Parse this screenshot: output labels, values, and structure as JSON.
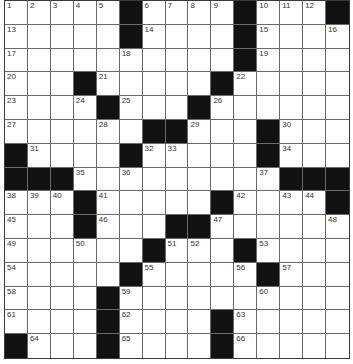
{
  "puzzle": {
    "rows": 15,
    "cols": 15,
    "colors": {
      "black": "#111111",
      "white": "#ffffff",
      "line": "#6a6a6a",
      "number": "#333333"
    },
    "grid": [
      ".....#....#...#",
      ".....#....#....",
      "..........#....",
      "...#.....#.....",
      "....#...#......",
      "......##...#...",
      "#....#.....#...",
      "###.........###",
      "...#.....#....#",
      "...#...##......",
      "......#...#....",
      ".....#.....#...",
      "....#..........",
      "....#....#.....",
      "#...#....#....."
    ],
    "numbers": [
      {
        "r": 1,
        "c": 1,
        "n": "1"
      },
      {
        "r": 1,
        "c": 2,
        "n": "2"
      },
      {
        "r": 1,
        "c": 3,
        "n": "3"
      },
      {
        "r": 1,
        "c": 4,
        "n": "4"
      },
      {
        "r": 1,
        "c": 5,
        "n": "5"
      },
      {
        "r": 1,
        "c": 7,
        "n": "6"
      },
      {
        "r": 1,
        "c": 8,
        "n": "7"
      },
      {
        "r": 1,
        "c": 9,
        "n": "8"
      },
      {
        "r": 1,
        "c": 10,
        "n": "9"
      },
      {
        "r": 1,
        "c": 12,
        "n": "10"
      },
      {
        "r": 1,
        "c": 13,
        "n": "11"
      },
      {
        "r": 1,
        "c": 14,
        "n": "12"
      },
      {
        "r": 2,
        "c": 1,
        "n": "13"
      },
      {
        "r": 2,
        "c": 7,
        "n": "14"
      },
      {
        "r": 2,
        "c": 12,
        "n": "15"
      },
      {
        "r": 2,
        "c": 15,
        "n": "16"
      },
      {
        "r": 3,
        "c": 1,
        "n": "17"
      },
      {
        "r": 3,
        "c": 6,
        "n": "18"
      },
      {
        "r": 3,
        "c": 12,
        "n": "19"
      },
      {
        "r": 4,
        "c": 1,
        "n": "20"
      },
      {
        "r": 4,
        "c": 5,
        "n": "21"
      },
      {
        "r": 4,
        "c": 11,
        "n": "22"
      },
      {
        "r": 5,
        "c": 1,
        "n": "23"
      },
      {
        "r": 5,
        "c": 4,
        "n": "24"
      },
      {
        "r": 5,
        "c": 6,
        "n": "25"
      },
      {
        "r": 5,
        "c": 10,
        "n": "26"
      },
      {
        "r": 6,
        "c": 1,
        "n": "27"
      },
      {
        "r": 6,
        "c": 5,
        "n": "28"
      },
      {
        "r": 6,
        "c": 9,
        "n": "29"
      },
      {
        "r": 6,
        "c": 13,
        "n": "30"
      },
      {
        "r": 7,
        "c": 2,
        "n": "31"
      },
      {
        "r": 7,
        "c": 7,
        "n": "32"
      },
      {
        "r": 7,
        "c": 8,
        "n": "33"
      },
      {
        "r": 7,
        "c": 13,
        "n": "34"
      },
      {
        "r": 8,
        "c": 4,
        "n": "35"
      },
      {
        "r": 8,
        "c": 6,
        "n": "36"
      },
      {
        "r": 8,
        "c": 12,
        "n": "37"
      },
      {
        "r": 9,
        "c": 1,
        "n": "38"
      },
      {
        "r": 9,
        "c": 2,
        "n": "39"
      },
      {
        "r": 9,
        "c": 3,
        "n": "40"
      },
      {
        "r": 9,
        "c": 5,
        "n": "41"
      },
      {
        "r": 9,
        "c": 11,
        "n": "42"
      },
      {
        "r": 9,
        "c": 13,
        "n": "43"
      },
      {
        "r": 9,
        "c": 14,
        "n": "44"
      },
      {
        "r": 10,
        "c": 1,
        "n": "45"
      },
      {
        "r": 10,
        "c": 5,
        "n": "46"
      },
      {
        "r": 10,
        "c": 10,
        "n": "47"
      },
      {
        "r": 10,
        "c": 15,
        "n": "48"
      },
      {
        "r": 11,
        "c": 1,
        "n": "49"
      },
      {
        "r": 11,
        "c": 4,
        "n": "50"
      },
      {
        "r": 11,
        "c": 8,
        "n": "51"
      },
      {
        "r": 11,
        "c": 9,
        "n": "52"
      },
      {
        "r": 11,
        "c": 12,
        "n": "53"
      },
      {
        "r": 12,
        "c": 1,
        "n": "54"
      },
      {
        "r": 12,
        "c": 7,
        "n": "55"
      },
      {
        "r": 12,
        "c": 11,
        "n": "56"
      },
      {
        "r": 12,
        "c": 13,
        "n": "57"
      },
      {
        "r": 13,
        "c": 1,
        "n": "58"
      },
      {
        "r": 13,
        "c": 6,
        "n": "59"
      },
      {
        "r": 13,
        "c": 12,
        "n": "60"
      },
      {
        "r": 14,
        "c": 1,
        "n": "61"
      },
      {
        "r": 14,
        "c": 6,
        "n": "62"
      },
      {
        "r": 14,
        "c": 11,
        "n": "63"
      },
      {
        "r": 15,
        "c": 2,
        "n": "64"
      },
      {
        "r": 15,
        "c": 6,
        "n": "65"
      },
      {
        "r": 15,
        "c": 11,
        "n": "66"
      }
    ]
  }
}
